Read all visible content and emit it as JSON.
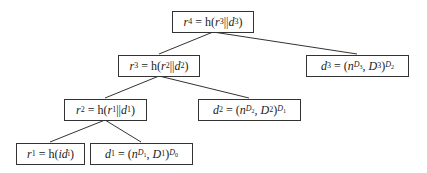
{
  "diagram": {
    "type": "hash-chain-tree",
    "line_color": "#333333",
    "nodes": [
      {
        "id": "r4",
        "label": "r4 = h(r3||d3)",
        "x": 172,
        "y": 11,
        "w": 82
      },
      {
        "id": "r3",
        "label": "r3 = h(r2||d2)",
        "x": 118,
        "y": 55,
        "w": 82
      },
      {
        "id": "d3",
        "label": "d3 = (nD3, D3)D2",
        "x": 306,
        "y": 55,
        "w": 103
      },
      {
        "id": "r2",
        "label": "r2 = h(r1||d1)",
        "x": 64,
        "y": 99,
        "w": 83
      },
      {
        "id": "d2",
        "label": "d2 = (nD2, D2)D1",
        "x": 198,
        "y": 99,
        "w": 103
      },
      {
        "id": "r1",
        "label": "r1 = h(idi)",
        "x": 16,
        "y": 143,
        "w": 69
      },
      {
        "id": "d1",
        "label": "d1 = (nD1, D1)D0",
        "x": 90,
        "y": 143,
        "w": 103
      }
    ],
    "edges": [
      {
        "from": "r4",
        "to": "r3"
      },
      {
        "from": "r4",
        "to": "d3"
      },
      {
        "from": "r3",
        "to": "r2"
      },
      {
        "from": "r3",
        "to": "d2"
      },
      {
        "from": "r2",
        "to": "r1"
      },
      {
        "from": "r2",
        "to": "d1"
      }
    ],
    "parts": {
      "r4": {
        "lhs": "r",
        "lhs_sub": "4",
        "rhs_pre": " = h(",
        "a": "r",
        "a_sub": "3",
        "sep": "||",
        "b": "d",
        "b_sub": "3",
        "close": ")"
      },
      "r3": {
        "lhs": "r",
        "lhs_sub": "3",
        "rhs_pre": " = h(",
        "a": "r",
        "a_sub": "2",
        "sep": "||",
        "b": "d",
        "b_sub": "2",
        "close": ")"
      },
      "r2": {
        "lhs": "r",
        "lhs_sub": "2",
        "rhs_pre": " = h(",
        "a": "r",
        "a_sub": "1",
        "sep": "||",
        "b": "d",
        "b_sub": "1",
        "close": ")"
      },
      "r1": {
        "lhs": "r",
        "lhs_sub": "1",
        "rhs_pre": " = h(",
        "a": "id",
        "a_sub": "i",
        "close": ")"
      },
      "d3": {
        "lhs": "d",
        "lhs_sub": "3",
        "open": " = (",
        "n": "n",
        "n_sub": "D",
        "n_subsub": "3",
        "comma": ", ",
        "D": "D",
        "D_sub": "3",
        "close": ")",
        "outer": "D",
        "outer_sub": "2"
      },
      "d2": {
        "lhs": "d",
        "lhs_sub": "2",
        "open": " = (",
        "n": "n",
        "n_sub": "D",
        "n_subsub": "2",
        "comma": ", ",
        "D": "D",
        "D_sub": "2",
        "close": ")",
        "outer": "D",
        "outer_sub": "1"
      },
      "d1": {
        "lhs": "d",
        "lhs_sub": "1",
        "open": " = (",
        "n": "n",
        "n_sub": "D",
        "n_subsub": "1",
        "comma": ", ",
        "D": "D",
        "D_sub": "1",
        "close": ")",
        "outer": "D",
        "outer_sub": "0"
      }
    }
  }
}
